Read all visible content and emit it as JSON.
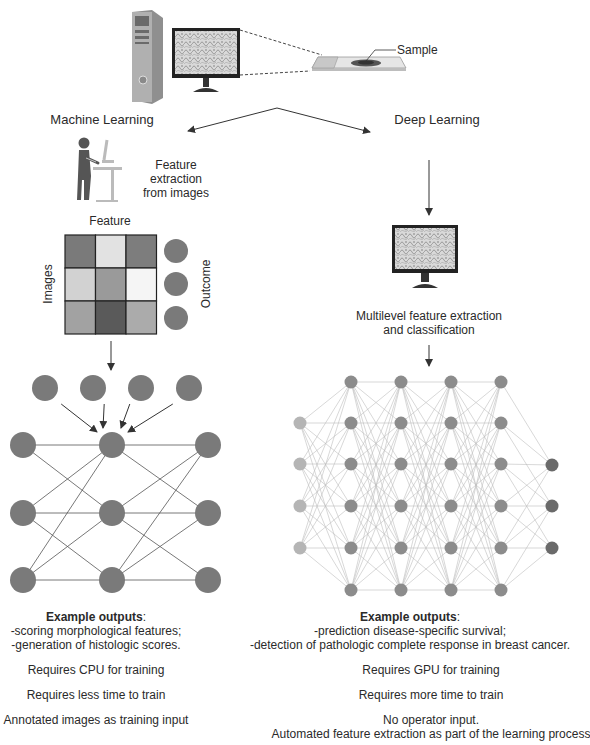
{
  "header": {
    "sample_label": "Sample"
  },
  "branches": {
    "machine_learning": {
      "title": "Machine Learning",
      "feature_extraction": [
        "Feature",
        "extraction",
        "from images"
      ],
      "matrix": {
        "col_label": "Feature",
        "row_label": "Images",
        "outcome_label": "Outcome",
        "cells": [
          [
            "#7a7a7a",
            "#e2e2e2",
            "#7d7d7d"
          ],
          [
            "#d2d2d2",
            "#9a9a9a",
            "#f5f5f5"
          ],
          [
            "#a2a2a2",
            "#5a5a5a",
            "#ababab"
          ]
        ]
      },
      "network": {
        "input_nodes_x": [
          45,
          93,
          141,
          189
        ],
        "input_nodes_y": 388,
        "layers_x": [
          23,
          112,
          208
        ],
        "rows_y": [
          445,
          513,
          580
        ]
      },
      "example_outputs": {
        "heading": "Example outputs",
        "colon": ":",
        "items": [
          "-scoring morphological features;",
          "-generation of histologic scores."
        ]
      },
      "requirements": [
        "Requires CPU for training",
        "Requires less time to train",
        "Annotated images as training input"
      ]
    },
    "deep_learning": {
      "title": "Deep Learning",
      "feature_extraction": [
        "Multilevel feature extraction",
        "and classification"
      ],
      "network": {
        "input_layer": {
          "x": 300,
          "rows_y": [
            423,
            464,
            506,
            548
          ],
          "color": "#b5b5b5"
        },
        "hidden_layers_x": [
          351,
          401,
          451,
          501
        ],
        "hidden_rows_y": [
          382,
          423,
          464,
          506,
          548,
          590
        ],
        "hidden_color": "#8c8c8c",
        "output_layer": {
          "x": 552,
          "rows_y": [
            465,
            506,
            548
          ],
          "color": "#6a6a6a"
        }
      },
      "example_outputs": {
        "heading": "Example outputs",
        "colon": ":",
        "items": [
          "-prediction disease-specific survival;",
          "-detection of pathologic complete response in breast cancer."
        ]
      },
      "requirements": [
        "Requires GPU for training",
        "Requires more time to train",
        "No operator input.",
        "Automated feature extraction as part of the learning process"
      ]
    }
  },
  "colors": {
    "node_ml": "#7a7a7a",
    "edge": "#555555",
    "edge_dl": "#bdbdbd",
    "arrow": "#333333"
  }
}
